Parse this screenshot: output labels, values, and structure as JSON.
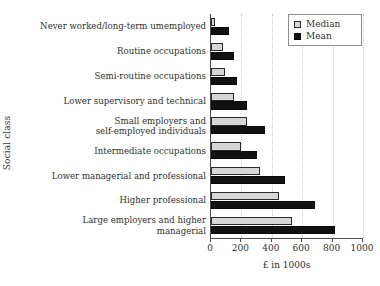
{
  "chart_data": {
    "type": "bar",
    "orientation": "horizontal",
    "title": "",
    "xlabel": "£ in 1000s",
    "ylabel": "Social class",
    "xlim": [
      0,
      1000
    ],
    "xticks": [
      0,
      200,
      400,
      600,
      800,
      1000
    ],
    "xtick_labels": [
      "0",
      "200",
      "400",
      "600",
      "800",
      "1000"
    ],
    "grid": "vertical-dotted",
    "legend_position": "top-right",
    "categories": [
      "Never worked/long-term umemployed",
      "Routine occupations",
      "Semi-routine occupations",
      "Lower supervisory and technical",
      "Small employers and\nself-employed individuals",
      "Intermediate occupations",
      "Lower managerial and professional",
      "Higher professional",
      "Large employers and higher\nmanagerial"
    ],
    "series": [
      {
        "name": "Median",
        "color": "#d6d6d6",
        "values": [
          25,
          80,
          90,
          150,
          235,
          200,
          320,
          450,
          530
        ]
      },
      {
        "name": "Mean",
        "color": "#121212",
        "values": [
          120,
          150,
          170,
          235,
          355,
          300,
          490,
          685,
          815
        ]
      }
    ]
  },
  "legend": {
    "entries": [
      {
        "label": "Median",
        "swatch": "median"
      },
      {
        "label": "Mean",
        "swatch": "mean"
      }
    ]
  }
}
